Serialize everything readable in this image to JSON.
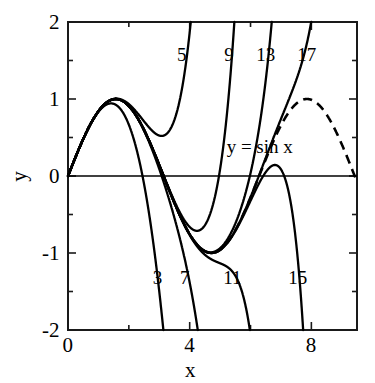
{
  "chart_data": {
    "type": "line",
    "title": "",
    "xlabel": "x",
    "ylabel": "y",
    "xlim": [
      0,
      9.5
    ],
    "ylim": [
      -2,
      2
    ],
    "grid": false,
    "legend": "inline-curve-labels",
    "x_ticks": [
      0,
      4,
      8
    ],
    "x_tick_labels": [
      "0",
      "4",
      "8"
    ],
    "x_minor_ticks": [
      2,
      6
    ],
    "y_ticks": [
      -2,
      -1,
      0,
      1,
      2
    ],
    "y_tick_labels": [
      "-2",
      "-1",
      "0",
      "1",
      "2"
    ],
    "y_minor_ticks": [
      -1.5,
      -0.5,
      0.5,
      1.5
    ],
    "annotations": [
      {
        "text": "y = sin x",
        "x": 6.3,
        "y": 0.38
      }
    ],
    "reference_curve": {
      "name": "y = sin x",
      "style": "dashed",
      "color": "#000000",
      "function": "sin"
    },
    "series": [
      {
        "name": "3",
        "degree": 3,
        "label": "3",
        "label_x": 2.95,
        "label_y": -1.32,
        "style": "solid",
        "color": "#000000"
      },
      {
        "name": "5",
        "degree": 5,
        "label": "5",
        "label_x": 3.75,
        "label_y": 1.58,
        "style": "solid",
        "color": "#000000"
      },
      {
        "name": "7",
        "degree": 7,
        "label": "7",
        "label_x": 3.85,
        "label_y": -1.32,
        "style": "solid",
        "color": "#000000"
      },
      {
        "name": "9",
        "degree": 9,
        "label": "9",
        "label_x": 5.3,
        "label_y": 1.58,
        "style": "solid",
        "color": "#000000"
      },
      {
        "name": "11",
        "degree": 11,
        "label": "11",
        "label_x": 5.4,
        "label_y": -1.32,
        "style": "solid",
        "color": "#000000"
      },
      {
        "name": "13",
        "degree": 13,
        "label": "13",
        "label_x": 6.5,
        "label_y": 1.58,
        "style": "solid",
        "color": "#000000"
      },
      {
        "name": "15",
        "degree": 15,
        "label": "15",
        "label_x": 7.55,
        "label_y": -1.32,
        "style": "solid",
        "color": "#000000"
      },
      {
        "name": "17",
        "degree": 17,
        "label": "17",
        "label_x": 7.85,
        "label_y": 1.58,
        "style": "solid",
        "color": "#000000"
      }
    ]
  },
  "axes": {
    "x_title": "x",
    "y_title": "y"
  },
  "colors": {
    "curve": "#000000",
    "frame": "#1a1a1a",
    "background": "#ffffff"
  }
}
